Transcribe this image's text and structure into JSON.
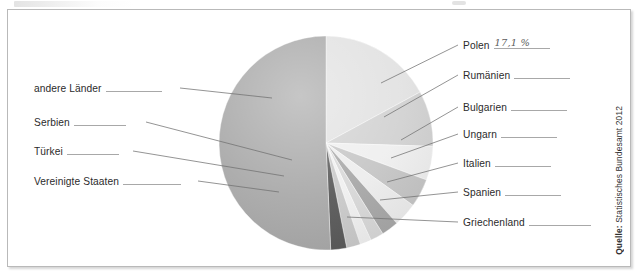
{
  "figure": {
    "source_note_key": "Quelle:",
    "source_note_value": " Statistisches Bundesamt 2012"
  },
  "chart_data": {
    "type": "pie",
    "title": "",
    "subtitle": "",
    "xlabel": "",
    "ylabel": "",
    "legend_position": "callout-labels",
    "grid": false,
    "units": "percent",
    "note": "Worksheet pie chart; only the Polen share is filled in by hand, remaining shares are blank answer lines.",
    "categories": [
      "Polen",
      "Rumänien",
      "Bulgarien",
      "Ungarn",
      "Italien",
      "Spanien",
      "Griechenland",
      "Vereinigte Staaten",
      "Türkei",
      "Serbien",
      "andere Länder"
    ],
    "values": [
      17.1,
      8.4,
      5.1,
      4.3,
      3.6,
      2.6,
      2.0,
      1.7,
      2.1,
      2.4,
      50.7
    ],
    "labels_shown": [
      "17,1 %",
      "",
      "",
      "",
      "",
      "",
      "",
      "",
      "",
      "",
      ""
    ],
    "colors": [
      "#e2e2e2",
      "#d2d2d2",
      "#efefef",
      "#c6c6c6",
      "#ededed",
      "#a8a8a8",
      "#d8d8d8",
      "#f0f0f0",
      "#cacaca",
      "#5a5a5a",
      "#a9a9a9"
    ]
  },
  "labels": {
    "right": [
      {
        "name": "polen",
        "text": "Polen",
        "answer": "17,1 %"
      },
      {
        "name": "rumaenien",
        "text": "Rumänien",
        "answer": ""
      },
      {
        "name": "bulgarien",
        "text": "Bulgarien",
        "answer": ""
      },
      {
        "name": "ungarn",
        "text": "Ungarn",
        "answer": ""
      },
      {
        "name": "italien",
        "text": "Italien",
        "answer": ""
      },
      {
        "name": "spanien",
        "text": "Spanien",
        "answer": ""
      },
      {
        "name": "griechenland",
        "text": "Griechenland",
        "answer": ""
      }
    ],
    "left": [
      {
        "name": "andere-laender",
        "text": "andere Länder",
        "answer": ""
      },
      {
        "name": "serbien",
        "text": "Serbien",
        "answer": ""
      },
      {
        "name": "tuerkei",
        "text": "Türkei",
        "answer": ""
      },
      {
        "name": "vereinigte-staaten",
        "text": "Vereinigte Staaten",
        "answer": ""
      }
    ]
  }
}
